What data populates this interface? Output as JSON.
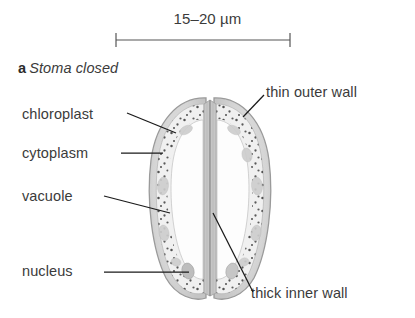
{
  "figure": {
    "panel_letter": "a",
    "panel_title": "Stoma closed",
    "scale_bar": {
      "caption": "15–20 µm",
      "x_start": 116,
      "x_end": 290,
      "y": 40
    }
  },
  "labels": {
    "chloroplast": "chloroplast",
    "cytoplasm": "cytoplasm",
    "vacuole": "vacuole",
    "nucleus": "nucleus",
    "thin_outer_wall": "thin outer wall",
    "thick_inner_wall": "thick inner wall"
  },
  "colors": {
    "background": "#ffffff",
    "text": "#3b3b3b",
    "leader_line": "#1a1a1a",
    "scale_bar": "#555555",
    "cell_outline": "#9a9a9a",
    "wall_fill": "#d8d8d8",
    "cytoplasm_fill": "#f2f2f2",
    "vacuole_fill": "#fdfdfd",
    "chloroplast_dot": "#4a4a4a",
    "nucleus_fill": "#bdbdbd",
    "inner_wall_fill": "#c9c9c9"
  },
  "diagram": {
    "type": "biological-cross-section",
    "cell_count": 2,
    "state": "closed",
    "bounds": {
      "left": 148,
      "right": 272,
      "top": 95,
      "bottom": 300
    },
    "pore_x": 210
  }
}
